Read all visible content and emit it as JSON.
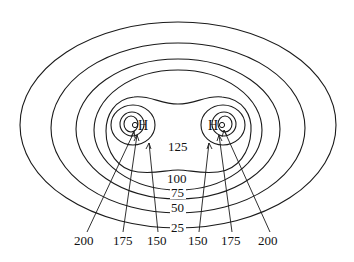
{
  "figure": {
    "atoms": [
      {
        "symbol": "H",
        "label_text": "oH",
        "side": "left"
      },
      {
        "symbol": "H",
        "label_text": "Ho",
        "side": "right"
      }
    ],
    "shared_contour_labels": [
      "125",
      "100",
      "75",
      "50",
      "25"
    ],
    "bottom_labels_left": [
      "200",
      "175",
      "150"
    ],
    "bottom_labels_right": [
      "150",
      "175",
      "200"
    ],
    "contour_values": [
      25,
      50,
      75,
      100,
      125,
      150,
      175,
      200
    ],
    "line_color": "#1a1a1a",
    "background": "#ffffff"
  }
}
